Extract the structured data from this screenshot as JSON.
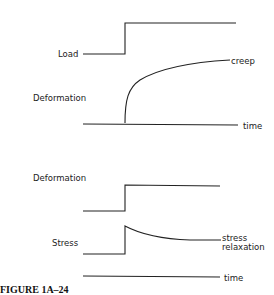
{
  "panels": {
    "creep": {
      "load_label": "Load",
      "deformation_label": "Deformation",
      "curve_label": "creep",
      "axis_label": "time"
    },
    "relaxation": {
      "deformation_label": "Deformation",
      "stress_label": "Stress",
      "curve_label_line1": "stress",
      "curve_label_line2": "relaxation",
      "axis_label": "time"
    }
  },
  "caption": "FIGURE 1A–24"
}
